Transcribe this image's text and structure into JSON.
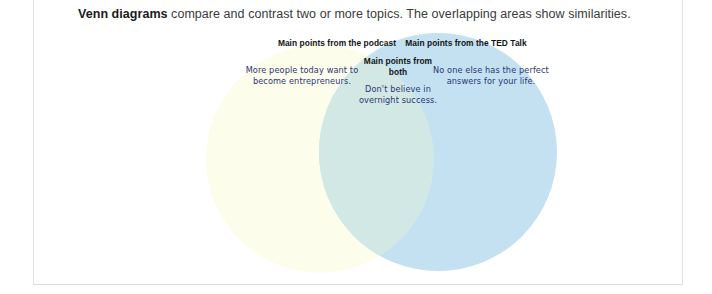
{
  "caption": {
    "lead": "Venn diagrams",
    "rest": " compare and contrast two or more topics. The overlapping areas show similarities."
  },
  "diagram": {
    "type": "venn",
    "sets": [
      {
        "id": "podcast",
        "position": "left",
        "heading": "Main points from the podcast",
        "content": "More people today want to become entrepreneurs.",
        "fill": "#fdfdec"
      },
      {
        "id": "ted",
        "position": "right",
        "heading": "Main points from the TED Talk",
        "content": "No one else has the perfect answers for your life.",
        "fill": "#c3e1f1"
      }
    ],
    "intersection": {
      "id": "both",
      "heading": "Main points from both",
      "content": "Don't believe in overnight success.",
      "fill": "#d2e8e5"
    },
    "heading_color": "#141414",
    "body_color": "#2e3573"
  }
}
